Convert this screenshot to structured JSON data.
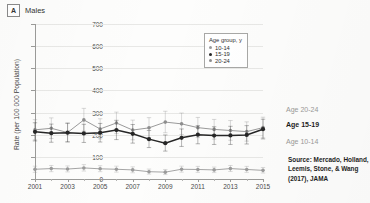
{
  "panel": {
    "letter": "A",
    "title": "Males"
  },
  "legend": {
    "title": "Age group, y",
    "items": [
      {
        "label": "10-14",
        "color": "#9b9b9b"
      },
      {
        "label": "15-19",
        "color": "#262626"
      },
      {
        "label": "20-24",
        "color": "#8e8e8e"
      }
    ]
  },
  "annotations": {
    "age_2024": "Age 20-24",
    "age_1519": "Age 15-19",
    "age_1014": "Age 10-14",
    "source": "Source: Mercado, Holland, Leemis, Stone, & Wang (2017), JAMA"
  },
  "chart_data": {
    "type": "line",
    "title": "Males",
    "xlabel": "",
    "ylabel": "Rate (per 100 000 Population)",
    "xlim": [
      2001,
      2015
    ],
    "ylim": [
      0,
      700
    ],
    "yticks": [
      0,
      100,
      200,
      300,
      400,
      500,
      600,
      700
    ],
    "xticks": [
      2001,
      2003,
      2005,
      2007,
      2009,
      2011,
      2013,
      2015
    ],
    "xtick_all": [
      2001,
      2002,
      2003,
      2004,
      2005,
      2006,
      2007,
      2008,
      2009,
      2010,
      2011,
      2012,
      2013,
      2014,
      2015
    ],
    "grid": "horizontal",
    "legend_position": "upper-right-inside",
    "errorbars": true,
    "x": [
      2001,
      2002,
      2003,
      2004,
      2005,
      2006,
      2007,
      2008,
      2009,
      2010,
      2011,
      2012,
      2013,
      2014,
      2015
    ],
    "series": [
      {
        "name": "10-14",
        "color": "#9b9b9b",
        "values": [
          44,
          47,
          45,
          50,
          46,
          44,
          41,
          33,
          31,
          44,
          43,
          41,
          47,
          43,
          39
        ],
        "err_low": [
          30,
          33,
          32,
          36,
          33,
          31,
          28,
          22,
          20,
          31,
          30,
          29,
          34,
          30,
          27
        ],
        "err_high": [
          58,
          61,
          59,
          65,
          60,
          58,
          55,
          45,
          43,
          58,
          57,
          54,
          61,
          57,
          52
        ]
      },
      {
        "name": "15-19",
        "color": "#262626",
        "values": [
          213,
          207,
          209,
          206,
          209,
          221,
          204,
          180,
          162,
          186,
          200,
          196,
          197,
          199,
          225
        ],
        "err_low": [
          172,
          166,
          168,
          165,
          167,
          178,
          162,
          142,
          126,
          147,
          159,
          156,
          156,
          158,
          181
        ],
        "err_high": [
          254,
          248,
          251,
          247,
          251,
          265,
          246,
          219,
          199,
          226,
          241,
          236,
          238,
          241,
          270
        ]
      },
      {
        "name": "20-24",
        "color": "#8e8e8e",
        "values": [
          222,
          229,
          210,
          267,
          226,
          253,
          221,
          231,
          257,
          249,
          232,
          224,
          219,
          214,
          232
        ],
        "err_low": [
          177,
          183,
          167,
          216,
          181,
          205,
          177,
          186,
          209,
          201,
          187,
          180,
          175,
          171,
          186
        ],
        "err_high": [
          268,
          276,
          254,
          319,
          272,
          302,
          266,
          277,
          306,
          298,
          278,
          269,
          264,
          258,
          279
        ]
      }
    ]
  }
}
